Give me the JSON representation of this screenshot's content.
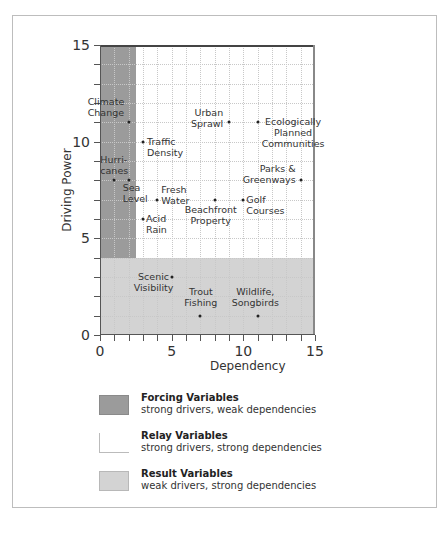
{
  "chart_data": {
    "type": "scatter",
    "title": "",
    "xlabel": "Dependency",
    "ylabel": "Driving Power",
    "xlim": [
      0,
      15
    ],
    "ylim": [
      0,
      15
    ],
    "x_ticks": [
      "0",
      "5",
      "10",
      "15"
    ],
    "y_ticks": [
      "0",
      "5",
      "10",
      "15"
    ],
    "grid": true,
    "regions": [
      {
        "name": "Forcing Variables",
        "x": [
          0,
          2.5
        ],
        "y": [
          4,
          15
        ],
        "color": "#9b9b9b"
      },
      {
        "name": "Relay Variables",
        "x": [
          2.5,
          15
        ],
        "y": [
          4,
          15
        ],
        "color": "#ffffff"
      },
      {
        "name": "Result Variables",
        "x": [
          0,
          15
        ],
        "y": [
          0,
          4
        ],
        "color": "#d3d3d3"
      }
    ],
    "points": [
      {
        "label": "Climate\nChange",
        "x": 2,
        "y": 11
      },
      {
        "label": "Traffic\nDensity",
        "x": 3,
        "y": 10
      },
      {
        "label": "Hurri-\ncanes",
        "x": 1,
        "y": 8
      },
      {
        "label": "Sea\nLevel",
        "x": 2,
        "y": 8
      },
      {
        "label": "Fresh\nWater",
        "x": 4,
        "y": 7
      },
      {
        "label": "Acid\nRain",
        "x": 3,
        "y": 6
      },
      {
        "label": "Urban\nSprawl",
        "x": 9,
        "y": 11
      },
      {
        "label": "Ecologically\nPlanned\nCommunities",
        "x": 11,
        "y": 11
      },
      {
        "label": "Parks &\nGreenways",
        "x": 14,
        "y": 8
      },
      {
        "label": "Beachfront\nProperty",
        "x": 8,
        "y": 7
      },
      {
        "label": "Golf\nCourses",
        "x": 10,
        "y": 7
      },
      {
        "label": "Scenic\nVisibility",
        "x": 5,
        "y": 3
      },
      {
        "label": "Trout\nFishing",
        "x": 7,
        "y": 1
      },
      {
        "label": "Wildlife,\nSongbirds",
        "x": 11,
        "y": 1
      }
    ]
  },
  "legend": {
    "items": [
      {
        "title": "Forcing Variables",
        "desc": "strong drivers, weak dependencies"
      },
      {
        "title": "Relay Variables",
        "desc": "strong drivers, strong dependencies"
      },
      {
        "title": "Result Variables",
        "desc": "weak drivers, strong dependencies"
      }
    ]
  }
}
